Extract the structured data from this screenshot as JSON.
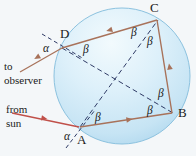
{
  "figure": {
    "background_color": "#f4f7f9",
    "sphere": {
      "name": "water-droplet",
      "center": [
        122,
        76
      ],
      "radius": 68,
      "fill_top_color": "#e6f2fa",
      "fill_bottom_color": "#bfdff1",
      "edge_color": "#8fc4e0"
    },
    "colors": {
      "ray_solid": "#a8725a",
      "ray_incoming": "#c0504a",
      "dashed_chord": "#2f3b66",
      "label_text": "#1b1b1b"
    },
    "vertices": [
      {
        "name": "vertex-A",
        "label": "A",
        "x": 80,
        "y": 127,
        "label_x": 78,
        "label_y": 133
      },
      {
        "name": "vertex-B",
        "label": "B",
        "x": 172,
        "y": 113,
        "label_x": 178,
        "label_y": 110
      },
      {
        "name": "vertex-C",
        "label": "C",
        "x": 157,
        "y": 20,
        "label_x": 152,
        "label_y": 2
      },
      {
        "name": "vertex-D",
        "label": "D",
        "x": 62,
        "y": 48,
        "label_x": 61,
        "label_y": 29
      }
    ],
    "angle_labels": [
      {
        "name": "angle-alpha-at-D",
        "label": "α",
        "x": 44,
        "y": 46
      },
      {
        "name": "angle-alpha-at-A",
        "label": "α",
        "x": 65,
        "y": 132
      },
      {
        "name": "angle-beta-at-D-inner",
        "label": "β",
        "x": 84,
        "y": 43
      },
      {
        "name": "angle-beta-at-C-left",
        "label": "β",
        "x": 132,
        "y": 28
      },
      {
        "name": "angle-beta-at-C-right",
        "label": "β",
        "x": 149,
        "y": 36
      },
      {
        "name": "angle-beta-at-B-upper",
        "label": "β",
        "x": 159,
        "y": 90
      },
      {
        "name": "angle-beta-at-B-lower",
        "label": "β",
        "x": 149,
        "y": 108
      },
      {
        "name": "angle-beta-at-A-inner",
        "label": "β",
        "x": 96,
        "y": 113
      }
    ],
    "annotations": [
      {
        "name": "to-observer-note",
        "lines": [
          "to",
          "observer"
        ],
        "x": 4,
        "y": 62
      },
      {
        "name": "from-sun-note",
        "lines": [
          "from",
          "sun"
        ],
        "x": 6,
        "y": 110
      }
    ],
    "ray_paths": {
      "incoming_from_sun": {
        "name": "incoming-sun-ray",
        "from": [
          14,
          114
        ],
        "to": [
          80,
          127
        ]
      },
      "outgoing_to_observer": {
        "name": "outgoing-observer-ray",
        "from": [
          62,
          48
        ],
        "to": [
          22,
          71
        ]
      },
      "chord_A_to_B": {
        "name": "chord-a-b",
        "from": [
          80,
          127
        ],
        "to": [
          172,
          113
        ]
      },
      "chord_B_to_C": {
        "name": "chord-b-c",
        "from": [
          172,
          113
        ],
        "to": [
          157,
          20
        ]
      },
      "chord_C_to_D": {
        "name": "chord-c-d",
        "from": [
          157,
          20
        ],
        "to": [
          62,
          48
        ]
      },
      "radius_dash_D_to_B": {
        "name": "dashed-radius-d-b",
        "from": [
          62,
          48
        ],
        "to": [
          172,
          113
        ]
      },
      "radius_dash_A_to_C": {
        "name": "dashed-radius-a-c",
        "from": [
          80,
          127
        ],
        "to": [
          157,
          20
        ]
      },
      "normal_dash_at_D": {
        "name": "dashed-normal-at-D",
        "from": [
          44,
          35
        ],
        "to": [
          82,
          58
        ]
      },
      "normal_dash_at_A": {
        "name": "dashed-normal-at-A",
        "from": [
          68,
          146
        ],
        "to": [
          93,
          112
        ]
      }
    }
  }
}
